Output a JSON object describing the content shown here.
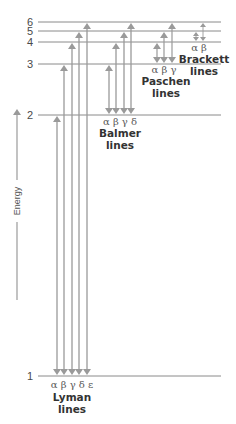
{
  "diagram": {
    "title": "",
    "axis": {
      "label": "Energy",
      "direction": "up"
    },
    "colors": {
      "level_line": "#8a8a8a",
      "arrow": "#9a9a9a",
      "text": "#333333",
      "greek": "#5a5a5a"
    },
    "levels": [
      {
        "n": "1",
        "y": 376
      },
      {
        "n": "2",
        "y": 115
      },
      {
        "n": "3",
        "y": 64
      },
      {
        "n": "4",
        "y": 42
      },
      {
        "n": "5",
        "y": 31
      },
      {
        "n": "6",
        "y": 22
      }
    ],
    "series": [
      {
        "name": "Lyman",
        "subtitle": "lines",
        "lower_level": 1,
        "greek": "α β γ δ ε",
        "transitions": [
          {
            "greek": "α",
            "upper": 2,
            "x": 57
          },
          {
            "greek": "β",
            "upper": 3,
            "x": 64
          },
          {
            "greek": "γ",
            "upper": 4,
            "x": 72
          },
          {
            "greek": "δ",
            "upper": 5,
            "x": 79
          },
          {
            "greek": "ε",
            "upper": 6,
            "x": 87
          }
        ]
      },
      {
        "name": "Balmer",
        "subtitle": "lines",
        "lower_level": 2,
        "greek": "α β γ δ",
        "transitions": [
          {
            "greek": "α",
            "upper": 3,
            "x": 109
          },
          {
            "greek": "β",
            "upper": 4,
            "x": 116
          },
          {
            "greek": "γ",
            "upper": 5,
            "x": 124
          },
          {
            "greek": "δ",
            "upper": 6,
            "x": 131
          }
        ]
      },
      {
        "name": "Paschen",
        "subtitle": "lines",
        "lower_level": 3,
        "greek": "α β γ",
        "transitions": [
          {
            "greek": "α",
            "upper": 4,
            "x": 157
          },
          {
            "greek": "β",
            "upper": 5,
            "x": 164
          },
          {
            "greek": "γ",
            "upper": 6,
            "x": 172
          }
        ]
      },
      {
        "name": "Brackett",
        "subtitle": "lines",
        "lower_level": 4,
        "greek": "α β",
        "transitions": [
          {
            "greek": "α",
            "upper": 5,
            "x": 196
          },
          {
            "greek": "β",
            "upper": 6,
            "x": 203
          }
        ]
      }
    ]
  }
}
